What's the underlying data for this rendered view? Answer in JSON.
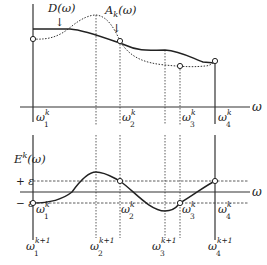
{
  "top_plot": {
    "x_axis_label": "ω",
    "curve_solid_label": "D(ω)",
    "curve_dotted_label": "A",
    "curve_dotted_label_sub": "k",
    "curve_dotted_label_tail": "(ω)",
    "ticks": [
      {
        "base": "ω",
        "sub": "1",
        "sup": "k"
      },
      {
        "base": "ω",
        "sub": "2",
        "sup": "k"
      },
      {
        "base": "ω",
        "sub": "3",
        "sup": "k"
      },
      {
        "base": "ω",
        "sub": "4",
        "sup": "k"
      }
    ]
  },
  "bottom_plot": {
    "y_axis_label": "E",
    "y_axis_label_sup": "k",
    "y_axis_label_tail": "(ω)",
    "x_axis_label": "ω",
    "plus_eps": "+ ε",
    "minus_eps": "− ε",
    "inner_ticks": [
      {
        "base": "ω",
        "sub": "1",
        "sup": "k"
      },
      {
        "base": "ω",
        "sub": "2",
        "sup": "k"
      },
      {
        "base": "ω",
        "sub": "3",
        "sup": "k"
      },
      {
        "base": "ω",
        "sub": "4",
        "sup": "k"
      }
    ],
    "outer_ticks": [
      {
        "base": "ω",
        "sub": "1",
        "sup": "k+1"
      },
      {
        "base": "ω",
        "sub": "2",
        "sup": "k+1"
      },
      {
        "base": "ω",
        "sub": "3",
        "sup": "k+1"
      },
      {
        "base": "ω",
        "sub": "4",
        "sup": "k+1"
      }
    ]
  },
  "arrows": {
    "down": "↓"
  }
}
